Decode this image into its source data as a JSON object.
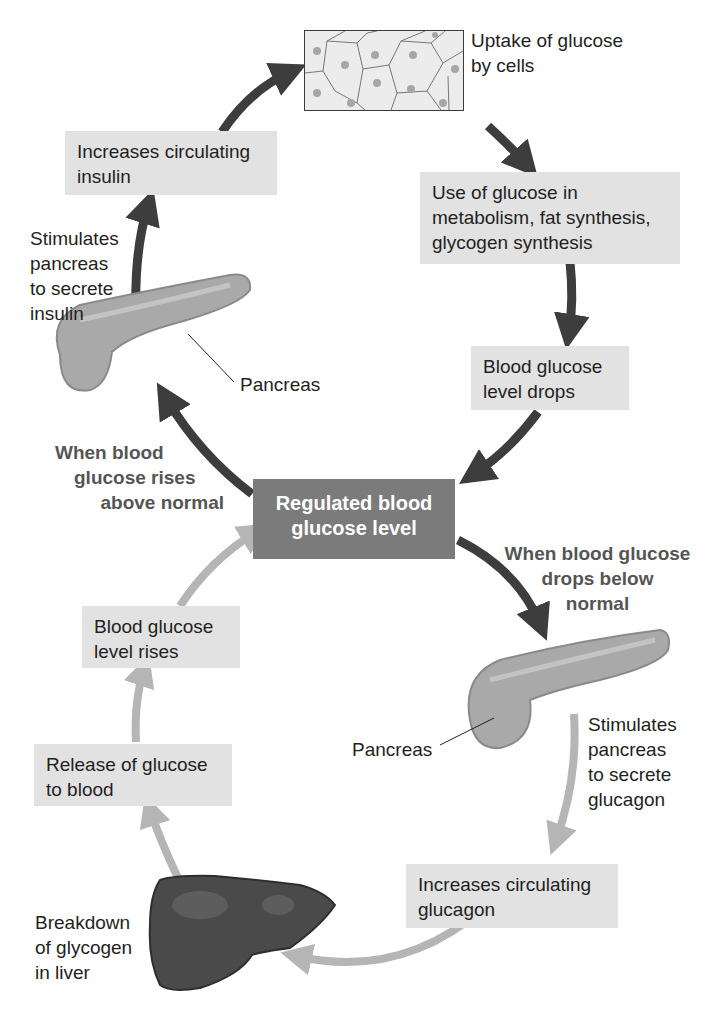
{
  "colors": {
    "box_fill": "#e2e2e2",
    "center_fill": "#7b7b7b",
    "insulin_path_arrow": "#3d3d3d",
    "glucagon_path_arrow": "#b5b5b5",
    "condition_text": "#555555"
  },
  "center": {
    "label": "Regulated blood glucose level"
  },
  "insulin_loop": {
    "condition": "When blood glucose rises above normal",
    "pancreas_label": "Pancreas",
    "stimulus": "Stimulates pancreas to secrete insulin",
    "hormone_effect": "Increases circulating insulin",
    "cells_image": "cells-illustration",
    "uptake": "Uptake of glucose by cells",
    "use": "Use of glucose in metabolism, fat synthesis, glycogen synthesis",
    "result": "Blood glucose level drops"
  },
  "glucagon_loop": {
    "condition": "When blood glucose drops below normal",
    "pancreas_label": "Pancreas",
    "stimulus": "Stimulates pancreas to secrete glucagon",
    "hormone_effect": "Increases circulating glucagon",
    "liver_label": "Breakdown of glycogen in liver",
    "release": "Release of glucose to blood",
    "result": "Blood glucose level rises"
  },
  "text_lines": {
    "uptake": [
      "Uptake of glucose",
      "by cells"
    ],
    "use": [
      "Use of glucose in",
      "metabolism, fat synthesis,",
      "glycogen synthesis"
    ],
    "drops": [
      "Blood glucose",
      "level drops"
    ],
    "center": [
      "Regulated blood",
      "glucose level"
    ],
    "rises_cond": [
      "When blood",
      "glucose rises",
      "above normal"
    ],
    "drops_cond": [
      "When blood glucose",
      "drops below",
      "normal"
    ],
    "insulin_effect": [
      "Increases circulating",
      "insulin"
    ],
    "insulin_stim": [
      "Stimulates",
      "pancreas",
      "to secrete",
      "insulin"
    ],
    "glucagon_stim": [
      "Stimulates",
      "pancreas",
      "to secrete",
      "glucagon"
    ],
    "glucagon_effect": [
      "Increases circulating",
      "glucagon"
    ],
    "liver": [
      "Breakdown",
      "of glycogen",
      "in liver"
    ],
    "release": [
      "Release of glucose",
      "to blood"
    ],
    "rises": [
      "Blood glucose",
      "level rises"
    ]
  }
}
